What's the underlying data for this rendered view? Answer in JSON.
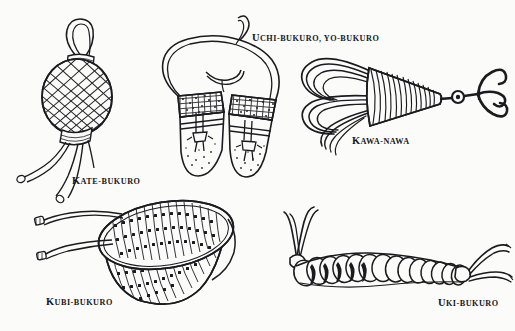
{
  "plate": {
    "title": "Japanese ninja equipment plate",
    "background_color": "#fbfbf9",
    "ink_color": "#1b1b1f",
    "width": 515,
    "height": 331,
    "style": "pen-and-ink line drawing, five labeled objects"
  },
  "labels": {
    "kate_bukuro": {
      "lead": "K",
      "rest": "ATE-BUKURO",
      "full": "Kate-bukuro"
    },
    "uchi_bukuro": {
      "lead": "U",
      "rest": "CHI-BUKURO, YO-BUKURO",
      "full": "Uchi-bukuro, yo-bukuro"
    },
    "kawa_nawa": {
      "lead": "K",
      "rest": "AWA-NAWA",
      "full": "Kawa-nawa"
    },
    "kubi_bukuro": {
      "lead": "K",
      "rest": "UBI-BUKURO",
      "full": "Kubi-bukuro"
    },
    "uki_bukuro": {
      "lead": "U",
      "rest": "KI-BUKURO",
      "full": "Uki-bukuro"
    }
  },
  "figures": [
    {
      "id": "kate-bukuro",
      "name": "Kate-bukuro",
      "description": "Oval rations pouch covered in diamond net mesh, with a carrying loop at the top, a bound neck band, a bound base band, and three long trailing draw cords with knotted tips.",
      "position": {
        "x": 30,
        "y": 18,
        "width": 110,
        "height": 170
      }
    },
    {
      "id": "uchi-bukuro",
      "name": "Uchi-bukuro, yo-bukuro",
      "description": "Pair of flat carrying pouches suspended from a single long looped shoulder cord. Each pouch has a stippled woven top band, a horizontal binding strap and a tied knot with hanging tassel ends; the lower bodies are lightly speckled.",
      "position": {
        "x": 152,
        "y": 22,
        "width": 145,
        "height": 155
      }
    },
    {
      "id": "kawa-nawa",
      "name": "Kawa-nawa",
      "description": "Coiled climbing rope gathered into loose loops at the left, bound into a tapered whipped cone to the right, terminating in a swivel ring and a three-pronged grappling hook.",
      "position": {
        "x": 300,
        "y": 48,
        "width": 210,
        "height": 90
      }
    },
    {
      "id": "kubi-bukuro",
      "name": "Kubi-bukuro",
      "description": "Open-mouthed knotted net bag drawn in perspective, the body formed of vertical cords joined by square mesh knots, with two long draw cords ending in small bound toggles at the left.",
      "position": {
        "x": 18,
        "y": 196,
        "width": 220,
        "height": 105
      }
    },
    {
      "id": "uki-bukuro",
      "name": "Uki-bukuro",
      "description": "Flotation device made of a row of about fourteen inflated bladder segments strung in a gentle arc, bound at each end where pairs of tie cords flare outward.",
      "position": {
        "x": 272,
        "y": 206,
        "width": 235,
        "height": 85
      }
    }
  ]
}
